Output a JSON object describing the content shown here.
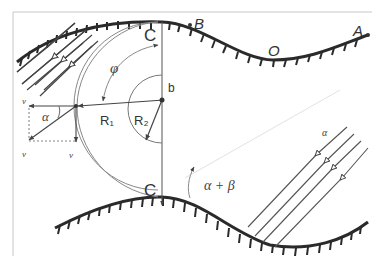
{
  "figure": {
    "labels": {
      "point_B": "B",
      "point_A": "A",
      "point_O": "O",
      "point_C_top": "C",
      "point_C_bottom": "C",
      "angle_phi": "φ",
      "length_b": "b",
      "radius_R1": "R₁",
      "radius_R2": "R₂",
      "angle_alpha_left": "α",
      "angle_alpha_beta": "α + β",
      "wave_label_right": "α",
      "velocity_x": "v",
      "velocity_total": "v",
      "velocity_y": "v"
    },
    "colors": {
      "wall": "#2a2a2a",
      "lines": "#555555",
      "arc": "#888888",
      "frame": "#bbbbbb"
    }
  }
}
